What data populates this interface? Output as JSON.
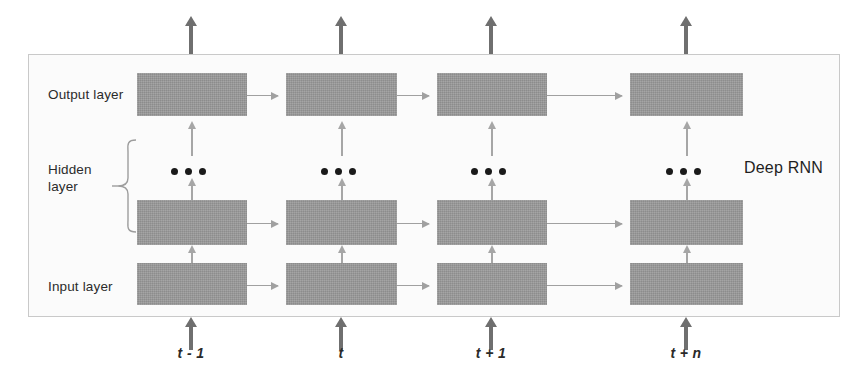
{
  "diagram": {
    "title": "Deep RNN",
    "frame": {
      "name": "network-boundary"
    },
    "layers": [
      {
        "id": "output",
        "label": "Output layer"
      },
      {
        "id": "hidden",
        "label": "Hidden\nlayer"
      },
      {
        "id": "input",
        "label": "Input layer"
      }
    ],
    "timesteps": [
      {
        "id": "t-minus-1",
        "label": "t - 1"
      },
      {
        "id": "t",
        "label": "t"
      },
      {
        "id": "t-plus-1",
        "label": "t + 1"
      },
      {
        "id": "t-plus-n",
        "label": "t + n"
      }
    ],
    "ellipsis": {
      "count": 3,
      "meaning": "additional stacked hidden layers"
    },
    "colors": {
      "node_fill": "#9a9a9a",
      "thin_arrow": "#a6a6a6",
      "bold_arrow": "#6f6f6f",
      "frame_border": "#c9c9c9",
      "frame_fill": "#fbfbfb",
      "text": "#2b2b2b",
      "dot": "#1a1a1a"
    },
    "connections": {
      "recurrent": "horizontal arrows left-to-right between consecutive timesteps in each layer",
      "feedforward": "vertical arrows upward from input layer to hidden layer to output layer",
      "external_input": "bold upward arrows entering the input layer from below",
      "external_output": "bold upward arrows leaving the output layer at the top"
    }
  }
}
